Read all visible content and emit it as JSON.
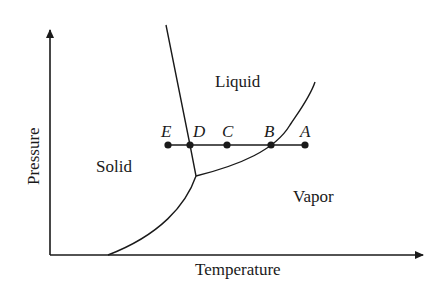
{
  "diagram": {
    "type": "phase-diagram",
    "axes": {
      "x_label": "Temperature",
      "y_label": "Pressure"
    },
    "regions": {
      "solid": "Solid",
      "liquid": "Liquid",
      "vapor": "Vapor"
    },
    "points": [
      {
        "id": "E",
        "label": "E"
      },
      {
        "id": "D",
        "label": "D"
      },
      {
        "id": "C",
        "label": "C"
      },
      {
        "id": "B",
        "label": "B"
      },
      {
        "id": "A",
        "label": "A"
      }
    ],
    "curves": [
      "melting-curve",
      "vaporization-curve",
      "sublimation-curve"
    ],
    "features": [
      "triple-point",
      "isobar-line"
    ],
    "colors": {
      "ink": "#1a1a1a",
      "background": "#ffffff"
    }
  }
}
